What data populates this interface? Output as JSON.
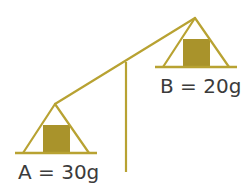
{
  "diagram": {
    "type": "balance-scale",
    "colors": {
      "frame": "#b8a232",
      "weight": "#a9932b",
      "text": "#3b3b3b",
      "background": "#ffffff"
    },
    "pans": [
      {
        "id": "A",
        "label": "A = 30g",
        "name": "A",
        "mass_g": 30,
        "position": "low-left"
      },
      {
        "id": "B",
        "label": "B = 20g",
        "name": "B",
        "mass_g": 20,
        "position": "high-right"
      }
    ]
  }
}
